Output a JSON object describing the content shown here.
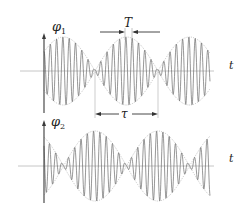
{
  "diagram": {
    "graphs": [
      {
        "id": "phi1",
        "ylabel": "φ",
        "ylabel_sub": "1",
        "xlabel": "t",
        "envelope": "cos",
        "annotation": {
          "label": "T",
          "type": "inward-arrows",
          "meaning": "carrier period"
        }
      },
      {
        "id": "phi2",
        "ylabel": "φ",
        "ylabel_sub": "2",
        "xlabel": "t",
        "envelope": "sin",
        "annotation": {
          "label": "τ",
          "type": "double-arrow",
          "meaning": "beat period"
        }
      }
    ],
    "colors": {
      "wave": "#6a6a6a",
      "envelope": "#9a9a9a",
      "axis": "#3a3a3a",
      "t_axis": "#b0b0b0",
      "text": "#222222"
    }
  }
}
